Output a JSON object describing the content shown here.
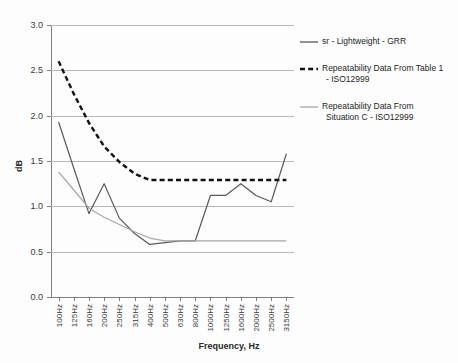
{
  "chart_data": {
    "type": "line",
    "title": "",
    "xlabel": "Frequency, Hz",
    "ylabel": "dB",
    "ylim": [
      0.0,
      3.0
    ],
    "ytick_labels": [
      "0.0",
      "0.5",
      "1.0",
      "1.5",
      "2.0",
      "2.5",
      "3.0"
    ],
    "ytick_values": [
      0.0,
      0.5,
      1.0,
      1.5,
      2.0,
      2.5,
      3.0
    ],
    "grid": true,
    "legend_position": "right",
    "categories": [
      "100Hz",
      "125Hz",
      "160Hz",
      "200Hz",
      "250Hz",
      "315Hz",
      "400Hz",
      "500Hz",
      "630Hz",
      "800Hz",
      "1000Hz",
      "1250Hz",
      "1600Hz",
      "2000Hz",
      "2500Hz",
      "3150Hz"
    ],
    "series": [
      {
        "name": "sr - Lightweight - GRR",
        "style": "solid",
        "color": "#595959",
        "values": [
          1.93,
          1.42,
          0.92,
          1.25,
          0.87,
          0.7,
          0.58,
          0.6,
          0.62,
          0.62,
          1.12,
          1.12,
          1.25,
          1.12,
          1.05,
          1.58
        ]
      },
      {
        "name": "Repeatability Data From Table 1 - ISO12999",
        "style": "dashed",
        "color": "#111111",
        "values": [
          2.6,
          2.24,
          1.92,
          1.66,
          1.49,
          1.36,
          1.29,
          1.29,
          1.29,
          1.29,
          1.29,
          1.29,
          1.29,
          1.29,
          1.29,
          1.29
        ]
      },
      {
        "name": "Repeatability Data From Situation C - ISO12999",
        "style": "solid",
        "color": "#a6a6a6",
        "values": [
          1.38,
          1.18,
          0.98,
          0.88,
          0.8,
          0.72,
          0.65,
          0.62,
          0.62,
          0.62,
          0.62,
          0.62,
          0.62,
          0.62,
          0.62,
          0.62
        ]
      }
    ],
    "legend": [
      {
        "label_line1": "sr - Lightweight - GRR",
        "label_line2": "",
        "style": "solid",
        "color": "#595959"
      },
      {
        "label_line1": "Repeatability Data From Table 1",
        "label_line2": "- ISO12999",
        "style": "dashed",
        "color": "#111111"
      },
      {
        "label_line1": "Repeatability Data From",
        "label_line2": "Situation C - ISO12999",
        "style": "solid",
        "color": "#a6a6a6"
      }
    ]
  }
}
